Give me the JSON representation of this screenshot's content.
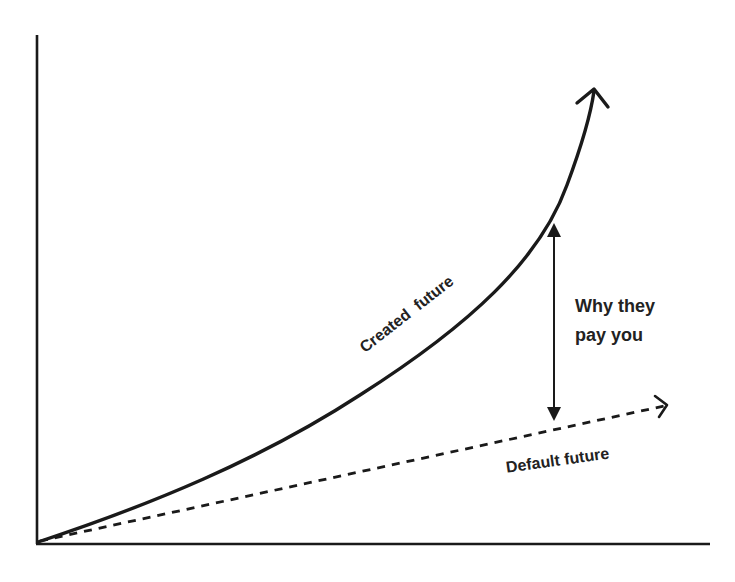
{
  "diagram": {
    "type": "conceptual-growth-chart",
    "axes": {
      "x_label": "",
      "y_label": ""
    },
    "curves": {
      "created": {
        "label": "Created  future",
        "style": "solid",
        "shape": "exponential",
        "color": "#1a1a1a"
      },
      "default": {
        "label": "Default future",
        "style": "dashed",
        "shape": "linear",
        "color": "#1a1a1a"
      }
    },
    "gap": {
      "label_line1": "Why they",
      "label_line2": "pay you",
      "arrow": "double-headed vertical"
    },
    "colors": {
      "background": "#ffffff",
      "ink": "#1a1a1a",
      "text": "#222222"
    }
  }
}
